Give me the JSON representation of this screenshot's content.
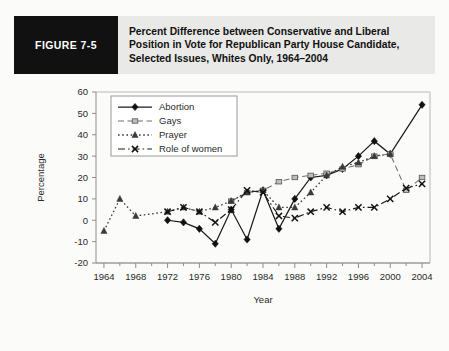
{
  "header": {
    "figure_tag": "FIGURE 7-5",
    "title_lines": [
      "Percent Difference between Conservative and Liberal",
      "Position in Vote for Republican Party House Candidate,",
      "Selected Issues, Whites Only, 1964–2004"
    ],
    "tag_background": "#111111",
    "band_background": "#e9e9e7"
  },
  "chart_data": {
    "type": "line",
    "title": "Percent Difference between Conservative and Liberal Position in Vote for Republican Party House Candidate, Selected Issues, Whites Only, 1964–2004",
    "xlabel": "Year",
    "ylabel": "Percentage",
    "xlim": [
      1963,
      2005
    ],
    "ylim": [
      -20,
      60
    ],
    "ytick_values": [
      -20,
      -10,
      0,
      10,
      20,
      30,
      40,
      50,
      60
    ],
    "ytick_labels": [
      "-20",
      "-10",
      "0",
      "10",
      "20",
      "30",
      "40",
      "50",
      "60"
    ],
    "xtick_values": [
      1964,
      1968,
      1972,
      1976,
      1980,
      1984,
      1988,
      1992,
      1996,
      2000,
      2004
    ],
    "xtick_labels": [
      "1964",
      "1968",
      "1972",
      "1976",
      "1980",
      "1984",
      "1988",
      "1992",
      "1996",
      "2000",
      "2004"
    ],
    "x_minor_step": 2,
    "grid": false,
    "legend_position": "upper-left-inside",
    "series": [
      {
        "name": "Abortion",
        "dash": "none",
        "marker": "diamond",
        "color": "#1a1a1a",
        "points": [
          [
            1972,
            0
          ],
          [
            1974,
            -1
          ],
          [
            1976,
            -4
          ],
          [
            1978,
            -11
          ],
          [
            1980,
            5
          ],
          [
            1982,
            -9
          ],
          [
            1984,
            14
          ],
          [
            1986,
            -4
          ],
          [
            1988,
            10
          ],
          [
            1990,
            20
          ],
          [
            1992,
            21
          ],
          [
            1994,
            24
          ],
          [
            1996,
            30
          ],
          [
            1998,
            37
          ],
          [
            2000,
            31
          ],
          [
            2004,
            54
          ]
        ]
      },
      {
        "name": "Gays",
        "dash": "dashed",
        "marker": "open-square",
        "color": "#6f6f6f",
        "points": [
          [
            1980,
            9
          ],
          [
            1982,
            13
          ],
          [
            1984,
            14
          ],
          [
            1986,
            18
          ],
          [
            1988,
            20
          ],
          [
            1990,
            21
          ],
          [
            1992,
            22
          ],
          [
            1994,
            24
          ],
          [
            1996,
            26
          ],
          [
            1998,
            30
          ],
          [
            2000,
            31
          ],
          [
            2002,
            14
          ],
          [
            2004,
            20
          ]
        ]
      },
      {
        "name": "Prayer",
        "dash": "dotted",
        "marker": "triangle",
        "color": "#3a3a3a",
        "points": [
          [
            1964,
            -5
          ],
          [
            1966,
            10
          ],
          [
            1968,
            2
          ],
          [
            1972,
            4
          ],
          [
            1974,
            6
          ],
          [
            1976,
            4
          ],
          [
            1978,
            6
          ],
          [
            1980,
            9
          ],
          [
            1982,
            13
          ],
          [
            1984,
            14
          ],
          [
            1986,
            6
          ],
          [
            1988,
            6
          ],
          [
            1990,
            13
          ],
          [
            1992,
            21
          ],
          [
            1994,
            25
          ],
          [
            1996,
            27
          ],
          [
            1998,
            30
          ],
          [
            2000,
            31
          ]
        ]
      },
      {
        "name": "Role of women",
        "dash": "dashdot",
        "marker": "cross",
        "color": "#1a1a1a",
        "points": [
          [
            1972,
            4
          ],
          [
            1974,
            6
          ],
          [
            1976,
            4
          ],
          [
            1978,
            -1
          ],
          [
            1980,
            5
          ],
          [
            1982,
            14
          ],
          [
            1984,
            13
          ],
          [
            1986,
            2
          ],
          [
            1988,
            1
          ],
          [
            1990,
            4
          ],
          [
            1992,
            6
          ],
          [
            1994,
            4
          ],
          [
            1996,
            6
          ],
          [
            1998,
            6
          ],
          [
            2000,
            10
          ],
          [
            2002,
            15
          ],
          [
            2004,
            17
          ]
        ]
      }
    ]
  }
}
